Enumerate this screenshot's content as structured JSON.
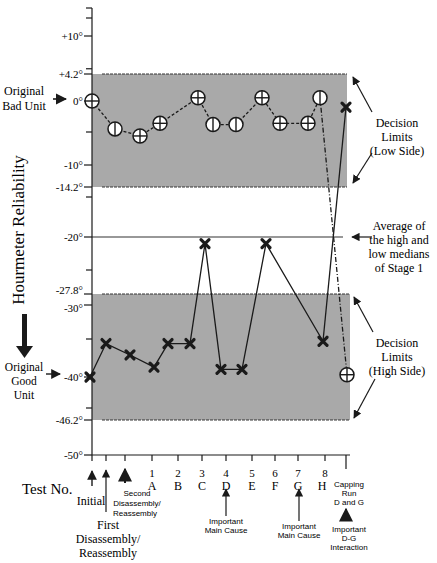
{
  "chart_data": {
    "type": "line",
    "title": "",
    "ylabel": "Hourmeter Reliability",
    "xlabel": "Test No.",
    "ylim": [
      -50,
      15
    ],
    "y_ticks": [
      {
        "value": 10,
        "label": "+10°"
      },
      {
        "value": 4.2,
        "label": "+4.2°"
      },
      {
        "value": 0,
        "label": "0°"
      },
      {
        "value": -10,
        "label": "-10°"
      },
      {
        "value": -14.2,
        "label": "-14.2°"
      },
      {
        "value": -20,
        "label": "-20°"
      },
      {
        "value": -27.8,
        "label": "-27.8°"
      },
      {
        "value": -30,
        "label": "-30°"
      },
      {
        "value": -40,
        "label": "-40°"
      },
      {
        "value": -46.2,
        "label": "-46.2°"
      },
      {
        "value": -50,
        "label": "-50°"
      }
    ],
    "y_minor_ticks": [
      15,
      5,
      -5,
      -15,
      -25,
      -35,
      -45
    ],
    "categories": [
      {
        "num": "",
        "letter": "",
        "note": "Initial"
      },
      {
        "num": "",
        "letter": "",
        "note": "First Disassembly/ Reassembly"
      },
      {
        "num": "",
        "letter": "",
        "note": "Second Disassembly/ Reassembly"
      },
      {
        "num": "1",
        "letter": "A",
        "note": ""
      },
      {
        "num": "2",
        "letter": "B",
        "note": ""
      },
      {
        "num": "3",
        "letter": "C",
        "note": ""
      },
      {
        "num": "4",
        "letter": "D",
        "note": "Important Main Cause"
      },
      {
        "num": "5",
        "letter": "E",
        "note": ""
      },
      {
        "num": "6",
        "letter": "F",
        "note": ""
      },
      {
        "num": "7",
        "letter": "G",
        "note": "Important Main Cause"
      },
      {
        "num": "8",
        "letter": "H",
        "note": ""
      },
      {
        "num": "",
        "letter": "",
        "note": "Capping Run D and G"
      }
    ],
    "series": [
      {
        "name": "Original Bad Unit",
        "marker": "circle-cross",
        "line": "dashed",
        "values": [
          0,
          -4.5,
          -5.6,
          -3.6,
          0.5,
          -3.8,
          -3.8,
          0.5,
          -3.6,
          -3.6,
          0.5,
          -39.7
        ]
      },
      {
        "name": "Original Good Unit",
        "marker": "x",
        "line": "solid",
        "values": [
          -40,
          -35.6,
          -37.1,
          -38.7,
          -35.6,
          -35.6,
          -21,
          -39,
          -39,
          -21,
          -35.3,
          -1
        ]
      }
    ],
    "bands": [
      {
        "name": "Decision Limits (Low Side)",
        "from": -14.2,
        "to": 4.2,
        "color": "#a9a9a9"
      },
      {
        "name": "Decision Limits (High Side)",
        "from": -46.2,
        "to": -27.8,
        "color": "#a9a9a9"
      }
    ],
    "reference_lines": [
      {
        "name": "Average of the high and low medians of Stage 1",
        "value": -20
      }
    ],
    "annotations": {
      "bad_unit": "Original Bad Unit",
      "good_unit": "Original Good Unit",
      "low_limits": "Decision Limits (Low Side)",
      "average": "Average of the high and low medians of Stage 1",
      "high_limits": "Decision Limits (High Side)",
      "test_no": "Test No.",
      "dg_interaction": "Important D-G Interaction"
    }
  },
  "text": {
    "ylabel": "Hourmeter  Reliability",
    "bad_unit_1": "Original",
    "bad_unit_2": "Bad Unit",
    "good_unit_1": "Original",
    "good_unit_2": "Good",
    "good_unit_3": "Unit",
    "low_1": "Decision",
    "low_2": "Limits",
    "low_3": "(Low Side)",
    "avg_1": "Average of",
    "avg_2": "the high and",
    "avg_3": "low medians",
    "avg_4": "of Stage 1",
    "high_1": "Decision",
    "high_2": "Limits",
    "high_3": "(High Side)",
    "test_no": "Test No.",
    "initial": "Initial",
    "first_1": "First",
    "first_2": "Disassembly/",
    "first_3": "Reassembly",
    "second_1": "Second",
    "second_2": "Disassembly/",
    "second_3": "Reassembly",
    "imp_main_1": "Important",
    "imp_main_2": "Main Cause",
    "capping_1": "Capping",
    "capping_2": "Run",
    "capping_3": "D and G",
    "dg_1": "Important",
    "dg_2": "D-G",
    "dg_3": "Interaction"
  }
}
